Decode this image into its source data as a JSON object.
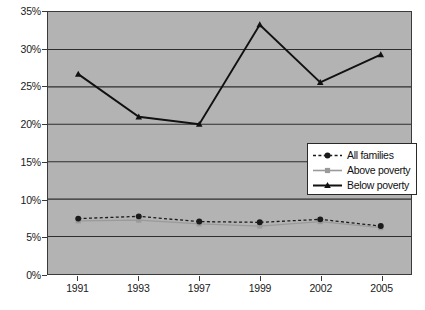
{
  "chart_data": {
    "type": "line",
    "title": "",
    "subtitle": "",
    "xlabel": "",
    "ylabel": "",
    "categories": [
      "1991",
      "1993",
      "1997",
      "1999",
      "2002",
      "2005"
    ],
    "ylim": [
      0,
      35
    ],
    "ytick_labels": [
      "0%",
      "5%",
      "10%",
      "15%",
      "20%",
      "25%",
      "30%",
      "35%"
    ],
    "ytick_values": [
      0,
      5,
      10,
      15,
      20,
      25,
      30,
      35
    ],
    "grid": true,
    "legend_position": "inside-bottom-right",
    "plot_background": "#b3b3b3",
    "series": [
      {
        "name": "All families",
        "values": [
          7.4,
          7.7,
          7.0,
          6.9,
          7.3,
          6.4
        ],
        "color": "#1a1a1a",
        "line_style": "dashed",
        "marker": "circle"
      },
      {
        "name": "Above poverty",
        "values": [
          7.1,
          7.2,
          6.7,
          6.4,
          7.0,
          6.2
        ],
        "color": "#9a9a9a",
        "line_style": "solid",
        "marker": "square"
      },
      {
        "name": "Below poverty",
        "values": [
          26.7,
          21.0,
          20.0,
          33.3,
          25.6,
          29.3
        ],
        "color": "#111111",
        "line_style": "solid",
        "marker": "triangle"
      }
    ]
  },
  "legend": {
    "items": [
      {
        "label": "All families"
      },
      {
        "label": "Above poverty"
      },
      {
        "label": "Below poverty"
      }
    ]
  }
}
